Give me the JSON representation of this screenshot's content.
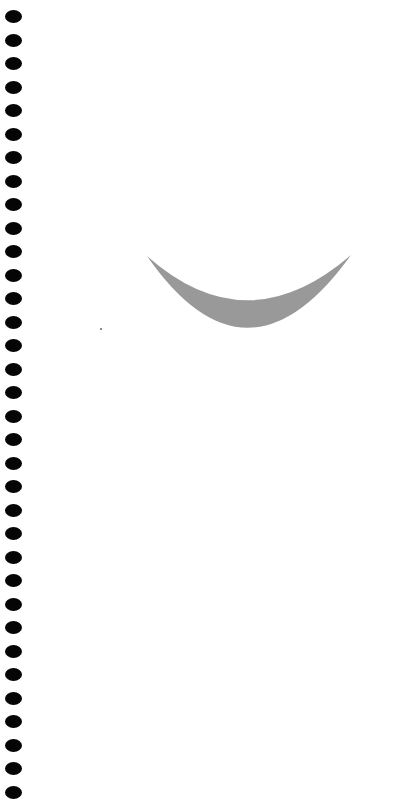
{
  "page": {
    "background": "#ffffff",
    "binding": {
      "hole_count": 34,
      "hole_color": "#050505",
      "first_hole_y": 16,
      "hole_spacing": 23.5
    },
    "shape": {
      "type": "crescent",
      "color": "#999999",
      "left_tip": [
        147,
        256
      ],
      "right_tip": [
        351,
        255
      ],
      "inner_bottom_y": 310,
      "outer_bottom_y": 358
    }
  }
}
